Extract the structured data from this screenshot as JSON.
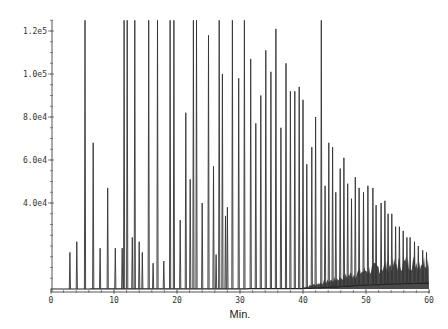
{
  "chart_data": {
    "type": "line",
    "subtype": "chromatogram",
    "title": "",
    "xlabel": "Min.",
    "ylabel": "",
    "xlim": [
      0,
      60
    ],
    "ylim": [
      0,
      125000
    ],
    "x_ticks": [
      0,
      10,
      20,
      30,
      40,
      50,
      60
    ],
    "x_tick_labels": [
      "0",
      "10",
      "20",
      "30",
      "40",
      "50",
      "60"
    ],
    "y_ticks": [
      40000,
      60000,
      80000,
      100000,
      120000
    ],
    "y_tick_labels": [
      "4.0e4",
      "6.0e4",
      "8.0e4",
      "1.0e5",
      "1.2e5"
    ],
    "y_minor_tick_step": 5000,
    "x_minor_tick_step": 2,
    "grid": false,
    "legend": "none",
    "clipped_peak_value": 125000,
    "peaks": {
      "x": [
        3.0,
        4.1,
        5.4,
        6.7,
        7.8,
        9.0,
        10.2,
        11.3,
        11.6,
        12.1,
        12.9,
        13.3,
        14.0,
        14.5,
        15.5,
        16.2,
        16.9,
        17.9,
        18.9,
        19.5,
        20.5,
        21.4,
        22.1,
        22.6,
        23.1,
        24.0,
        25.0,
        25.8,
        26.2,
        26.7,
        27.2,
        27.7,
        28.0,
        28.8,
        29.8,
        30.7,
        31.7,
        32.5,
        33.3,
        34.1,
        34.9,
        35.7,
        36.5,
        37.3,
        38.0,
        38.7,
        39.4,
        40.0,
        40.6,
        41.4,
        42.0,
        42.9,
        43.5,
        44.1,
        44.7,
        45.2,
        45.9,
        46.5,
        47.1,
        47.7,
        48.3,
        48.9,
        49.6,
        50.3,
        51.1,
        51.6,
        52.4,
        53.0,
        53.5,
        54.1,
        54.7,
        55.3,
        55.9,
        56.5,
        57.0,
        57.7,
        58.3,
        59.0,
        59.6
      ],
      "y": [
        17000,
        22000,
        125000,
        68000,
        19000,
        47000,
        19000,
        19000,
        125000,
        125000,
        24000,
        125000,
        22000,
        17000,
        125000,
        12000,
        125000,
        13000,
        125000,
        125000,
        32000,
        82000,
        51000,
        125000,
        125000,
        40000,
        118000,
        57000,
        16000,
        125000,
        100000,
        34000,
        38000,
        125000,
        98000,
        125000,
        107000,
        77000,
        90000,
        111000,
        101000,
        121000,
        75000,
        105000,
        92000,
        92000,
        94000,
        88000,
        58000,
        66000,
        80000,
        125000,
        48000,
        68000,
        66000,
        45000,
        56000,
        61000,
        49000,
        42000,
        52000,
        47000,
        45000,
        48000,
        47000,
        39000,
        40000,
        41000,
        35000,
        35000,
        29000,
        29000,
        27000,
        24000,
        24000,
        22000,
        20000,
        18000,
        17000
      ],
      "note": "Peaks at 125000 are clipped at the top of the plot"
    },
    "baseline_rise": {
      "x": [
        0,
        40,
        45,
        50,
        55,
        60
      ],
      "y": [
        0,
        500,
        3000,
        6000,
        8000,
        9000
      ]
    }
  }
}
